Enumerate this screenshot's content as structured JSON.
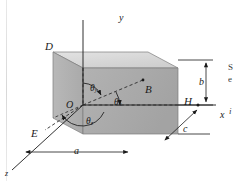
{
  "figure": {
    "type": "3d-rectangular-box-direction-angles",
    "background": "#ffffff",
    "ink": "#1a1a1a",
    "face_colors": {
      "front": "#a9a9a9",
      "right": "#9e9e9e",
      "top": "#d6d6d6",
      "bottom_shadow": "#c9c9c9"
    }
  },
  "axes": [
    {
      "name": "y-axis",
      "label": "y",
      "x": 119,
      "y": 13
    },
    {
      "name": "x-axis",
      "label": "x",
      "x": 220,
      "y": 116
    },
    {
      "name": "z-axis",
      "label": "z",
      "x": 5,
      "y": 172
    }
  ],
  "vertices": [
    {
      "name": "vertex-D",
      "label": "D",
      "x": 45,
      "y": 47
    },
    {
      "name": "vertex-B",
      "label": "B",
      "x": 144,
      "y": 90
    },
    {
      "name": "vertex-O",
      "label": "O",
      "x": 66,
      "y": 105
    },
    {
      "name": "vertex-E",
      "label": "E",
      "x": 36,
      "y": 134
    },
    {
      "name": "vertex-H",
      "label": "H",
      "x": 189,
      "y": 105
    }
  ],
  "angles": [
    {
      "name": "angle-theta-y",
      "symbol": "θ",
      "subscript": "y",
      "x": 93,
      "y": 89
    },
    {
      "name": "angle-theta-x",
      "symbol": "θ",
      "subscript": "x",
      "x": 113,
      "y": 103
    },
    {
      "name": "angle-theta-z",
      "symbol": "θ",
      "subscript": "z",
      "x": 89,
      "y": 119
    }
  ],
  "dimensions": [
    {
      "name": "dimension-a",
      "label": "a",
      "x": 76,
      "y": 155
    },
    {
      "name": "dimension-b",
      "label": "b",
      "x": 202,
      "y": 78
    },
    {
      "name": "dimension-c",
      "label": "c",
      "x": 186,
      "y": 127
    }
  ],
  "margin_text": {
    "line1": "S",
    "line2": "e",
    "line3": "i"
  }
}
